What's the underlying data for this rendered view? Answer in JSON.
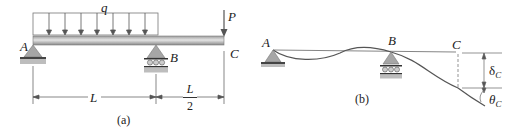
{
  "figure_a": {
    "caption": "(a)",
    "load_label": "q",
    "point_load_label": "P",
    "support_a_label": "A",
    "support_b_label": "B",
    "end_label": "C",
    "span_ab_label": "L",
    "overhang_numerator": "L",
    "overhang_denominator": "2"
  },
  "figure_b": {
    "caption": "(b)",
    "support_a_label": "A",
    "support_b_label": "B",
    "end_label": "C",
    "deflection_symbol": "δ",
    "deflection_subscript": "C",
    "rotation_symbol": "θ",
    "rotation_subscript": "C"
  },
  "colors": {
    "beam": "#c8c8c8",
    "beam_edge": "#7a7a7a",
    "support": "#9a9a9a",
    "line": "#555555"
  }
}
